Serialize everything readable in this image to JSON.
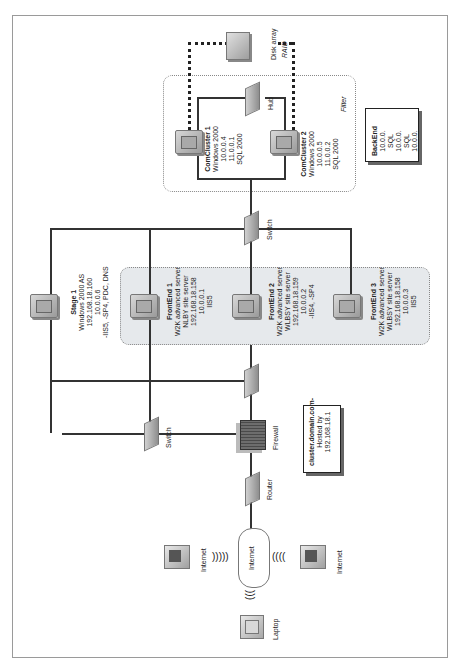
{
  "diagram": {
    "orientation": "rotated -90deg (text reads bottom-to-top)",
    "regions": {
      "filter_label": "Filter"
    },
    "nodes": {
      "disk_array": {
        "label": "Disk array",
        "sublabel": "RAID"
      },
      "hub": {
        "label": "Hub"
      },
      "comcluster1": {
        "title": "ComCluster 1",
        "lines": [
          "Windows 2000",
          "10.0.0.4",
          "11.0.0.1",
          "SQL 2000"
        ]
      },
      "comcluster2": {
        "title": "ComCluster 2",
        "lines": [
          "Windows 2000",
          "10.0.0.5",
          "11.0.0.2",
          "SQL 2000"
        ]
      },
      "backend": {
        "title": "BackEnd",
        "lines": [
          "10.0.0.",
          "SQL",
          "10.0.0.",
          "SQL",
          "10.0.0."
        ]
      },
      "switch_top": {
        "label": "Switch"
      },
      "stage1": {
        "title": "Stage 1",
        "lines": [
          "Windows 2000 AS",
          "192.168.18.160",
          "10.0.0.6",
          "-IIS5, -SP4, PDC, DNS"
        ]
      },
      "frontend1": {
        "title": "FrontEnd 1",
        "lines": [
          "W2K advanced server",
          "NLBY site server",
          "192.168.18.158",
          "10.0.0.1",
          "IIS5"
        ]
      },
      "frontend2": {
        "title": "FrontEnd 2",
        "lines": [
          "W2K advanced server",
          "WLBSY site server",
          "192.168.18.159",
          "10.0.0.2",
          "-IIS4, -SP4"
        ]
      },
      "frontend3": {
        "title": "FrontEnd 3",
        "lines": [
          "W2K advanced server",
          "WLBSY site server",
          "192.168.18.158",
          "10.0.0.3",
          "IIS5"
        ]
      },
      "switch_left": {
        "label": "Switch"
      },
      "firewall": {
        "label": "Firewall"
      },
      "router": {
        "label": "Router"
      },
      "cluster_info": {
        "lines": [
          "cluster.domain.com-",
          "Hosted by",
          "192.168.18.1"
        ]
      },
      "internet_cloud": {
        "label": "Internet"
      },
      "client_left": {
        "label": "Internet"
      },
      "client_right": {
        "label": "Internet"
      },
      "laptop": {
        "label": "Laptop"
      }
    }
  }
}
